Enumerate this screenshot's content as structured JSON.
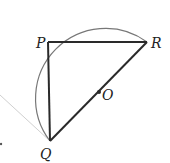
{
  "diagram": {
    "points": {
      "P": {
        "label": "P",
        "x": 48,
        "y": 42
      },
      "Q": {
        "label": "Q",
        "x": 50,
        "y": 141
      },
      "R": {
        "label": "R",
        "x": 147,
        "y": 42
      },
      "O": {
        "label": "O",
        "x": 99,
        "y": 92
      }
    },
    "segments": [
      "PR",
      "PQ",
      "QR"
    ],
    "arc": {
      "from": "Q",
      "to": "R",
      "center": "O",
      "side": "left-top"
    },
    "colors": {
      "stroke": "#2a2a2a",
      "arc": "#777777",
      "faint_line": "#bbbbbb"
    }
  }
}
